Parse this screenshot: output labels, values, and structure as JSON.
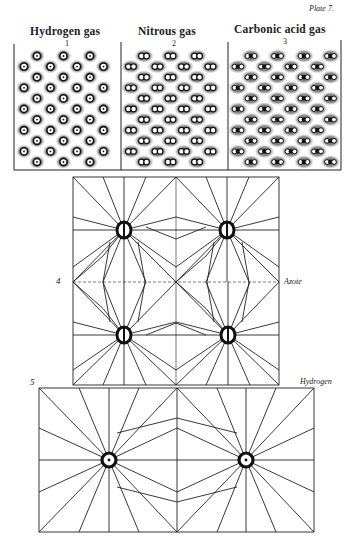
{
  "plate": {
    "label": "Plate 7."
  },
  "panels": [
    {
      "title": "Hydrogen gas",
      "number": "1",
      "particle": "single-atom"
    },
    {
      "title": "Nitrous gas",
      "number": "2",
      "particle": "two-atom"
    },
    {
      "title": "Carbonic acid gas",
      "number": "3",
      "particle": "three-atom"
    }
  ],
  "figure4": {
    "number": "4",
    "label": "Azote"
  },
  "figure5": {
    "number": "5",
    "label": "Hydrogen"
  },
  "colors": {
    "ink": "#111111",
    "halo": "#9a9a9a",
    "paper": "#ffffff"
  }
}
